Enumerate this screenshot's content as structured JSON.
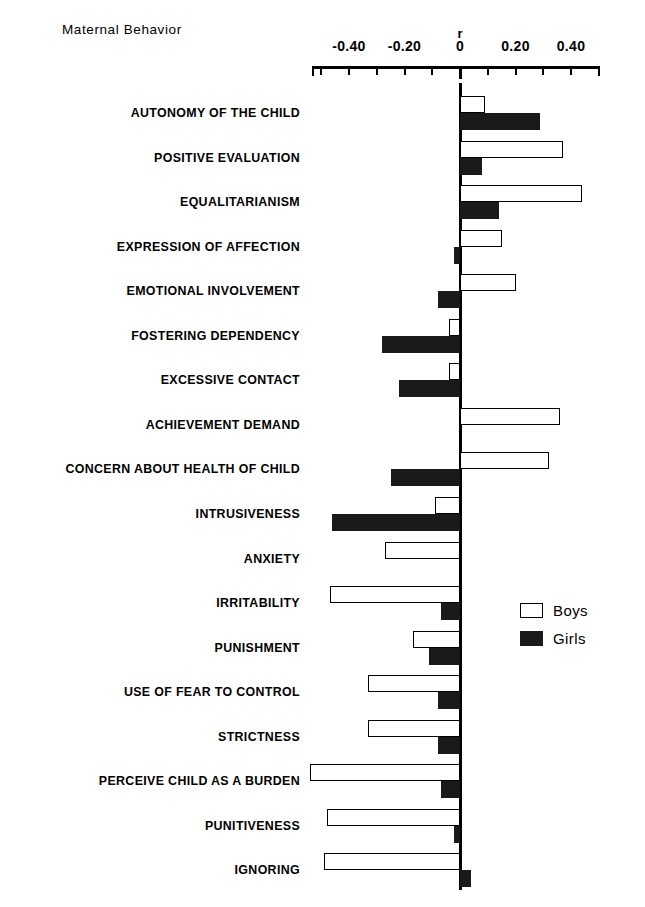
{
  "chart_title": "Maternal Behavior",
  "axis": {
    "unit_label": "r",
    "tick_labels": [
      "-0.40",
      "-0.20",
      "0",
      "0.20",
      "0.40"
    ],
    "tick_label_values": [
      -0.4,
      -0.2,
      0,
      0.2,
      0.4
    ],
    "minor_tick_values": [
      -0.5,
      -0.4,
      -0.3,
      -0.2,
      -0.1,
      0,
      0.1,
      0.2,
      0.3,
      0.4,
      0.5
    ],
    "axis_min": -0.54,
    "axis_max": 0.51
  },
  "legend": {
    "position": "middle-right",
    "entries": [
      {
        "label": "Boys",
        "swatch": "open-white-square",
        "color": "#ffffff"
      },
      {
        "label": "Girls",
        "swatch": "filled-black-square",
        "color": "#1a1a1a"
      }
    ]
  },
  "chart_data": {
    "type": "bar",
    "orientation": "horizontal",
    "title": "Maternal Behavior",
    "xlabel": "r",
    "ylabel": "",
    "xlim": [
      -0.54,
      0.51
    ],
    "grid": false,
    "legend_position": "middle-right",
    "categories": [
      "AUTONOMY OF THE CHILD",
      "POSITIVE EVALUATION",
      "EQUALITARIANISM",
      "EXPRESSION OF AFFECTION",
      "EMOTIONAL INVOLVEMENT",
      "FOSTERING DEPENDENCY",
      "EXCESSIVE CONTACT",
      "ACHIEVEMENT DEMAND",
      "CONCERN ABOUT HEALTH OF CHILD",
      "INTRUSIVENESS",
      "ANXIETY",
      "IRRITABILITY",
      "PUNISHMENT",
      "USE OF FEAR TO CONTROL",
      "STRICTNESS",
      "PERCEIVE CHILD AS A BURDEN",
      "PUNITIVENESS",
      "IGNORING"
    ],
    "series": [
      {
        "name": "Boys",
        "color": "#ffffff",
        "values": [
          0.09,
          0.37,
          0.44,
          0.15,
          0.2,
          -0.04,
          -0.04,
          0.36,
          0.32,
          -0.09,
          -0.27,
          -0.47,
          -0.17,
          -0.33,
          -0.33,
          -0.54,
          -0.48,
          -0.49
        ]
      },
      {
        "name": "Girls",
        "color": "#1a1a1a",
        "values": [
          0.29,
          0.08,
          0.14,
          -0.02,
          -0.08,
          -0.28,
          -0.22,
          0.0,
          -0.25,
          -0.46,
          0.0,
          -0.07,
          -0.11,
          -0.08,
          -0.08,
          -0.07,
          -0.02,
          0.04
        ]
      }
    ]
  }
}
